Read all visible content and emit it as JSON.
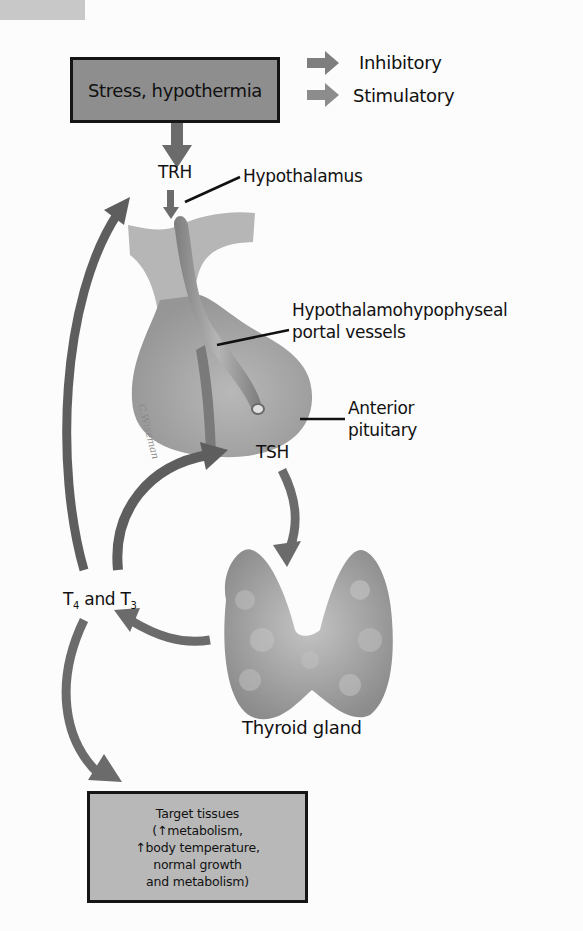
{
  "legend": [
    {
      "label": "Inhibitory",
      "color": "#7a7a7a"
    },
    {
      "label": "Stimulatory",
      "color": "#8a8a8a"
    }
  ],
  "nodes": {
    "stimulus": "Stress, hypothermia",
    "trh": "TRH",
    "hypothalamus": "Hypothalamus",
    "portal_vessels_line1": "Hypothalamohypophyseal",
    "portal_vessels_line2": "portal vessels",
    "anterior_pituitary_line1": "Anterior",
    "anterior_pituitary_line2": "pituitary",
    "tsh": "TSH",
    "hormones_t4": "T",
    "hormones_t4_sub": "4",
    "hormones_and": " and T",
    "hormones_t3_sub": "3",
    "thyroid": "Thyroid gland"
  },
  "target_tissues": {
    "lines": [
      "Target tissues",
      "(↑metabolism,",
      "↑body temperature,",
      "normal growth",
      "and metabolism)"
    ]
  },
  "artist_signature": "C.Wiseman",
  "colors": {
    "arrow": "#6e6e6e",
    "arrow_dark": "#4a4a4a",
    "box_top_fill": "#8e8e8e",
    "box_bottom_fill": "#b8b8b8",
    "tissue": "#aaaaaa",
    "background": "#fcfcfc"
  }
}
